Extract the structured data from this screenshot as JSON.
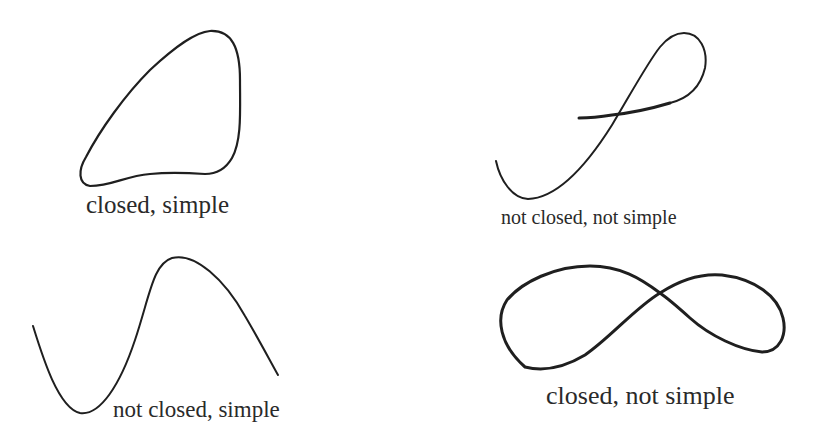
{
  "diagram": {
    "stroke_color": "#1f1f1f",
    "background": "#ffffff",
    "panels": [
      {
        "id": "closed-simple",
        "label": "closed, simple",
        "closed": true,
        "simple": true,
        "shape": "rounded triangular closed loop"
      },
      {
        "id": "not-closed-not-simple",
        "label": "not closed, not simple",
        "closed": false,
        "simple": false,
        "shape": "open curve crossing itself with a loop at the top"
      },
      {
        "id": "not-closed-simple",
        "label": "not closed, simple",
        "closed": false,
        "simple": true,
        "shape": "open wave: dip then peak"
      },
      {
        "id": "closed-not-simple",
        "label": "closed, not simple",
        "closed": true,
        "simple": false,
        "shape": "figure-eight"
      }
    ]
  }
}
